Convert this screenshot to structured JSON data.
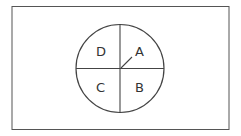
{
  "diagram": {
    "type": "circle-quadrants",
    "quadrants": [
      {
        "label": "A",
        "position": "top-right"
      },
      {
        "label": "B",
        "position": "bottom-right"
      },
      {
        "label": "C",
        "position": "bottom-left"
      },
      {
        "label": "D",
        "position": "top-left"
      }
    ],
    "colors": {
      "stroke": "#444444",
      "background": "#ffffff"
    }
  }
}
